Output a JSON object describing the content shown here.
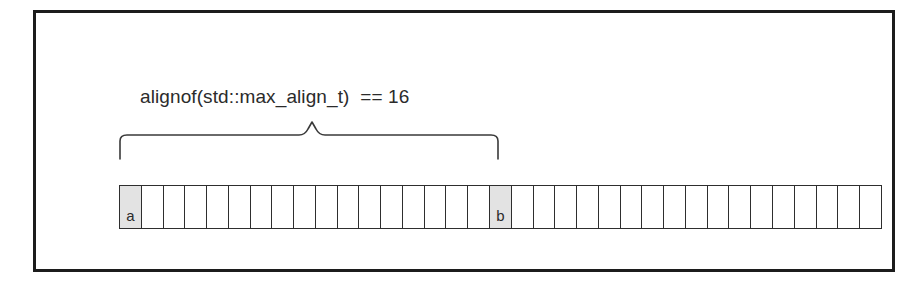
{
  "figure": {
    "caption": "alignof(std::max_align_t)  == 16",
    "brace": {
      "label_for": "alignof(std::max_align_t)  == 16",
      "spans_cells": 17,
      "start_cell_index": 0,
      "end_cell_index": 17
    },
    "memory_strip": {
      "total_cells": 35,
      "cells": [
        {
          "index": 0,
          "label": "a",
          "shaded": true
        },
        {
          "index": 1,
          "label": "",
          "shaded": false
        },
        {
          "index": 2,
          "label": "",
          "shaded": false
        },
        {
          "index": 3,
          "label": "",
          "shaded": false
        },
        {
          "index": 4,
          "label": "",
          "shaded": false
        },
        {
          "index": 5,
          "label": "",
          "shaded": false
        },
        {
          "index": 6,
          "label": "",
          "shaded": false
        },
        {
          "index": 7,
          "label": "",
          "shaded": false
        },
        {
          "index": 8,
          "label": "",
          "shaded": false
        },
        {
          "index": 9,
          "label": "",
          "shaded": false
        },
        {
          "index": 10,
          "label": "",
          "shaded": false
        },
        {
          "index": 11,
          "label": "",
          "shaded": false
        },
        {
          "index": 12,
          "label": "",
          "shaded": false
        },
        {
          "index": 13,
          "label": "",
          "shaded": false
        },
        {
          "index": 14,
          "label": "",
          "shaded": false
        },
        {
          "index": 15,
          "label": "",
          "shaded": false
        },
        {
          "index": 16,
          "label": "",
          "shaded": false
        },
        {
          "index": 17,
          "label": "b",
          "shaded": true
        },
        {
          "index": 18,
          "label": "",
          "shaded": false
        },
        {
          "index": 19,
          "label": "",
          "shaded": false
        },
        {
          "index": 20,
          "label": "",
          "shaded": false
        },
        {
          "index": 21,
          "label": "",
          "shaded": false
        },
        {
          "index": 22,
          "label": "",
          "shaded": false
        },
        {
          "index": 23,
          "label": "",
          "shaded": false
        },
        {
          "index": 24,
          "label": "",
          "shaded": false
        },
        {
          "index": 25,
          "label": "",
          "shaded": false
        },
        {
          "index": 26,
          "label": "",
          "shaded": false
        },
        {
          "index": 27,
          "label": "",
          "shaded": false
        },
        {
          "index": 28,
          "label": "",
          "shaded": false
        },
        {
          "index": 29,
          "label": "",
          "shaded": false
        },
        {
          "index": 30,
          "label": "",
          "shaded": false
        },
        {
          "index": 31,
          "label": "",
          "shaded": false
        },
        {
          "index": 32,
          "label": "",
          "shaded": false
        },
        {
          "index": 33,
          "label": "",
          "shaded": false
        },
        {
          "index": 34,
          "label": "",
          "shaded": false
        }
      ]
    },
    "colors": {
      "frame": "#1c1c1c",
      "cell_border": "#2e2e2e",
      "cell_shaded_fill": "#e3e3e3",
      "cell_fill": "#ffffff",
      "text": "#2b2b2b",
      "brace_stroke": "#3a3a3a"
    }
  }
}
